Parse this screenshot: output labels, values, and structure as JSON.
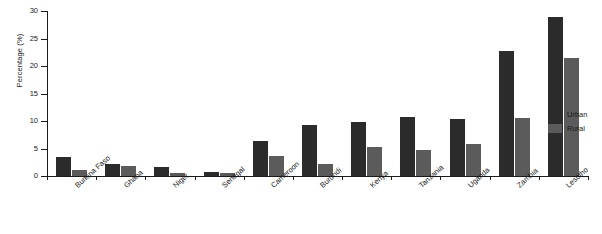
{
  "chart_data": {
    "type": "bar",
    "title": "",
    "xlabel": "",
    "ylabel": "Percentage (%)",
    "ylim": [
      0,
      30
    ],
    "yticks": [
      0,
      5,
      10,
      15,
      20,
      25,
      30
    ],
    "grid": false,
    "legend_position": "right",
    "categories": [
      "Burkina Faso",
      "Ghana",
      "Niger",
      "Senegal",
      "Cameroon",
      "Burundi",
      "Kenya",
      "Tanzania",
      "Uganda",
      "Zambia",
      "Lesotho"
    ],
    "series": [
      {
        "name": "Urban",
        "color": "#2b2b2b",
        "values": [
          3.5,
          2.2,
          1.6,
          0.7,
          6.4,
          9.2,
          9.9,
          10.7,
          10.4,
          22.8,
          28.9
        ]
      },
      {
        "name": "Rural",
        "color": "#5b5b5b",
        "values": [
          1.1,
          1.9,
          0.5,
          0.6,
          3.6,
          2.2,
          5.3,
          4.8,
          5.9,
          10.5,
          21.5
        ]
      }
    ]
  },
  "legend": {
    "items": [
      {
        "label": "Urban"
      },
      {
        "label": "Rural"
      }
    ]
  }
}
